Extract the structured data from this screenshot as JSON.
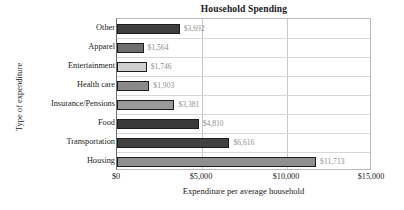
{
  "chart_data": {
    "type": "bar",
    "orientation": "horizontal",
    "title": "Household Spending",
    "xlabel": "Expenditure per average household",
    "ylabel": "Type of expenditure",
    "xlim": [
      0,
      15000
    ],
    "ylim": null,
    "grid": true,
    "legend": null,
    "categories": [
      "Other",
      "Apparel",
      "Entertainment",
      "Health care",
      "Insurance/Pensions",
      "Food",
      "Transportation",
      "Housing"
    ],
    "values": [
      3692,
      1564,
      1746,
      1903,
      3381,
      4810,
      6616,
      11713
    ],
    "value_labels": [
      "$3,692",
      "$1,564",
      "$1,746",
      "$1,903",
      "$3,381",
      "$4,810",
      "$6,616",
      "$11,713"
    ],
    "bar_colors": [
      "#3f3f3f",
      "#6e6e6e",
      "#cfcfcf",
      "#8a8a8a",
      "#9a9a9a",
      "#3a3a3a",
      "#424242",
      "#8f8f8f"
    ],
    "xticks": [
      0,
      5000,
      10000,
      15000
    ],
    "xtick_labels": [
      "$0",
      "$5,000",
      "$10,000",
      "$15,000"
    ],
    "value_label_color": "#8f8f8f",
    "bar_edge_color": "#1c1c1c",
    "plot_border_color": "#b9b9b9",
    "gridline_color": "#c8c8c8"
  }
}
